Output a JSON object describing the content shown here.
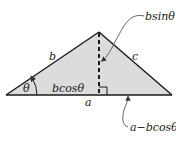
{
  "diagram": {
    "type": "triangle-height-decomposition",
    "colors": {
      "fill": "#dcdcdc",
      "stroke": "#1a1a1a",
      "background": "#ffffff"
    },
    "labels": {
      "side_b": "b",
      "side_c": "c",
      "side_a": "a",
      "angle": "θ",
      "adjacent": "bcosθ",
      "height": "bsinθ",
      "remainder": "a−bcosθ"
    }
  }
}
